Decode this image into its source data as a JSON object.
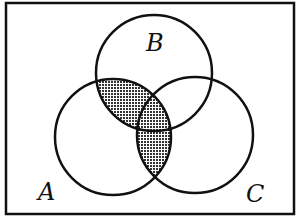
{
  "diagram": {
    "type": "venn",
    "universe": {
      "x": 6,
      "y": 3,
      "width": 288,
      "height": 211
    },
    "sets": [
      {
        "name": "A",
        "label": "A",
        "cx": 113,
        "cy": 137,
        "r": 58,
        "label_x": 47,
        "label_y": 200
      },
      {
        "name": "B",
        "label": "B",
        "cx": 154,
        "cy": 73,
        "r": 58,
        "label_x": 155,
        "label_y": 50
      },
      {
        "name": "C",
        "label": "C",
        "cx": 195,
        "cy": 135,
        "r": 58,
        "label_x": 256,
        "label_y": 202
      }
    ],
    "shaded_region": "A ∩ (B ∪ C)",
    "shade_color": "#555555",
    "stroke_color": "#111111"
  }
}
